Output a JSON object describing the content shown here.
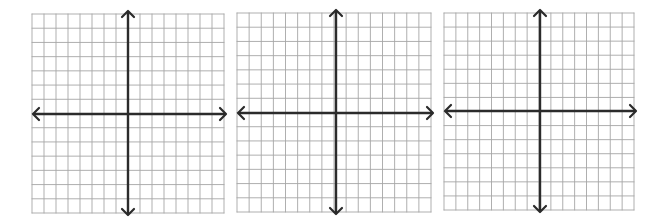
{
  "figure": {
    "colors": {
      "background": "#ffffff",
      "grid_line": "#a6a6a6",
      "grid_border": "#9a9a9a",
      "axis": "#2b2b2b"
    },
    "panels": [
      {
        "id": "graph-1",
        "grid": {
          "x": 32,
          "y": 14,
          "width": 192,
          "height": 199,
          "cols": 16,
          "rows": 14
        },
        "axis": {
          "x": 128,
          "y": 114
        },
        "x_axis_extent": [
          33,
          226
        ],
        "y_axis_extent": [
          11,
          215
        ]
      },
      {
        "id": "graph-2",
        "grid": {
          "x": 237,
          "y": 13,
          "width": 194,
          "height": 199,
          "cols": 16,
          "rows": 14
        },
        "axis": {
          "x": 336,
          "y": 113
        },
        "x_axis_extent": [
          238,
          433
        ],
        "y_axis_extent": [
          10,
          214
        ]
      },
      {
        "id": "graph-3",
        "grid": {
          "x": 444,
          "y": 13,
          "width": 190,
          "height": 197,
          "cols": 16,
          "rows": 14
        },
        "axis": {
          "x": 540,
          "y": 111
        },
        "x_axis_extent": [
          445,
          636
        ],
        "y_axis_extent": [
          10,
          212
        ]
      }
    ]
  }
}
